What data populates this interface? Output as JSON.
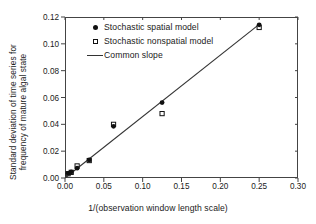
{
  "figure": {
    "background": "#ffffff",
    "frame_color": "#444444"
  },
  "axes": {
    "x_label": "1/(observation window length scale)",
    "y_label_line1": "Standard deviation of time series for",
    "y_label_line2": "frequency of mature algal state",
    "x_ticks": [
      "0.00",
      "0.05",
      "0.10",
      "0.15",
      "0.20",
      "0.25",
      "0.30"
    ],
    "y_ticks": [
      "0.00",
      "0.02",
      "0.04",
      "0.06",
      "0.08",
      "0.10",
      "0.12"
    ]
  },
  "legend": {
    "items": [
      {
        "label": "Stochastic spatial model",
        "marker": "filled-circle-marker"
      },
      {
        "label": "Stochastic nonspatial model",
        "marker": "open-square-marker"
      },
      {
        "label": "Common slope",
        "marker": "line-marker"
      }
    ]
  },
  "chart_data": {
    "type": "scatter",
    "title": "",
    "xlabel": "1/(observation window length scale)",
    "ylabel": "Standard deviation of time series for frequency of mature algal state",
    "xlim": [
      0.0,
      0.3
    ],
    "ylim": [
      0.0,
      0.12
    ],
    "xticks": [
      0.0,
      0.05,
      0.1,
      0.15,
      0.2,
      0.25,
      0.3
    ],
    "yticks": [
      0.0,
      0.02,
      0.04,
      0.06,
      0.08,
      0.1,
      0.12
    ],
    "grid": false,
    "legend_position": "upper-left-inside",
    "series": [
      {
        "name": "Stochastic spatial model",
        "marker": "filled circle",
        "color": "#111111",
        "x": [
          0.004,
          0.008,
          0.0156,
          0.0312,
          0.0625,
          0.125,
          0.25
        ],
        "y": [
          0.0035,
          0.0045,
          0.0073,
          0.0135,
          0.0385,
          0.0562,
          0.1142
        ]
      },
      {
        "name": "Stochastic nonspatial model",
        "marker": "open square",
        "color": "#111111",
        "x": [
          0.004,
          0.008,
          0.0156,
          0.0312,
          0.0625,
          0.125,
          0.25
        ],
        "y": [
          0.0032,
          0.0042,
          0.009,
          0.013,
          0.04,
          0.048,
          0.1122
        ]
      }
    ],
    "fit_line": {
      "name": "Common slope",
      "color": "#333333",
      "x": [
        0.0,
        0.25
      ],
      "y": [
        0.0,
        0.1145
      ],
      "slope": 0.458,
      "intercept": 0.0
    }
  }
}
